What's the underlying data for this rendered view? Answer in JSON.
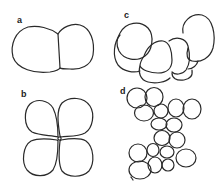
{
  "figure": {
    "stroke_color": "#2a2a2a",
    "background": "#ffffff",
    "panels": [
      {
        "id": "a",
        "label": "a",
        "cells": 2,
        "arrangement": "two-cell stage"
      },
      {
        "id": "b",
        "label": "b",
        "cells": 4,
        "arrangement": "four-cell stage, cross pattern"
      },
      {
        "id": "c",
        "label": "c",
        "cells": 8,
        "arrangement": "eight-cell stage, curved row"
      },
      {
        "id": "d",
        "label": "d",
        "cells": 18,
        "arrangement": "multicellular cluster"
      }
    ]
  }
}
